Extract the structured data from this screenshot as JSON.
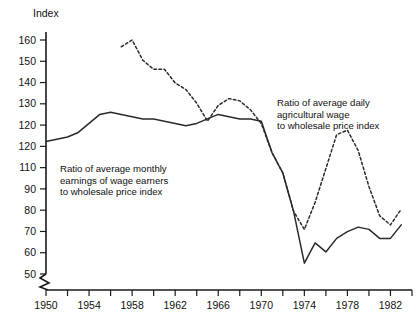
{
  "chart_data": {
    "type": "line",
    "title": "",
    "ylabel": "Index",
    "xlabel": "",
    "ylim": [
      50,
      165
    ],
    "xlim": [
      1950,
      1984
    ],
    "grid": false,
    "legend_position": "inline-annotations",
    "y_ticks": [
      160,
      150,
      140,
      130,
      120,
      120,
      110,
      90,
      80,
      70,
      60,
      50
    ],
    "y_tick_labels": [
      "160",
      "150",
      "140",
      "130",
      "120",
      "120",
      "110",
      "90",
      "80",
      "70",
      "60",
      "50"
    ],
    "x_ticks": [
      1950,
      1952,
      1954,
      1956,
      1958,
      1960,
      1962,
      1964,
      1966,
      1968,
      1970,
      1972,
      1974,
      1976,
      1978,
      1980,
      1982,
      1984
    ],
    "x_tick_labels": [
      "1950",
      "",
      "1954",
      "",
      "1958",
      "",
      "1962",
      "",
      "1966",
      "",
      "1970",
      "",
      "1974",
      "",
      "1978",
      "",
      "1982",
      ""
    ],
    "axis_break": true,
    "series": [
      {
        "name": "Ratio of average monthly earnings of wage earners to wholesale price index",
        "style": "solid",
        "x": [
          1950,
          1951,
          1952,
          1953,
          1954,
          1955,
          1956,
          1957,
          1958,
          1959,
          1960,
          1961,
          1962,
          1963,
          1964,
          1965,
          1966,
          1967,
          1968,
          1969,
          1970,
          1971,
          1972,
          1973,
          1974,
          1975,
          1976,
          1977,
          1978,
          1979,
          1980,
          1981,
          1982,
          1983
        ],
        "values": [
          115,
          116,
          117,
          119,
          123,
          127,
          128,
          127,
          126,
          125,
          125,
          124,
          123,
          122,
          123,
          125,
          127,
          126,
          125,
          125,
          124,
          110,
          101,
          84,
          61,
          70,
          66,
          72,
          75,
          77,
          76,
          72,
          72,
          78
        ]
      },
      {
        "name": "Ratio of average daily agricultural wage to wholesale price index",
        "style": "dashed",
        "x": [
          1957,
          1958,
          1959,
          1960,
          1961,
          1962,
          1963,
          1964,
          1965,
          1966,
          1967,
          1968,
          1969,
          1970,
          1971,
          1972,
          1973,
          1974,
          1975,
          1976,
          1977,
          1978,
          1979,
          1980,
          1981,
          1982,
          1983
        ],
        "values": [
          157,
          160,
          151,
          147,
          147,
          141,
          138,
          132,
          124,
          131,
          134,
          133,
          129,
          123,
          110,
          101,
          84,
          76,
          88,
          103,
          118,
          120,
          111,
          95,
          82,
          78,
          85
        ]
      }
    ],
    "annotations": [
      {
        "id": "annotation-monthly-earnings",
        "lines": [
          "Ratio of average monthly",
          "earnings of wage earners",
          "to wholesale price index"
        ]
      },
      {
        "id": "annotation-agricultural-wage",
        "lines": [
          "Ratio of average daily",
          "agricultural wage",
          "to wholesale price index"
        ]
      }
    ]
  }
}
